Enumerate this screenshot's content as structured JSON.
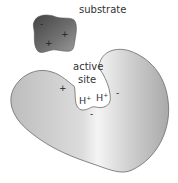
{
  "diagram": {
    "substrate": {
      "label": "substrate",
      "charges": [
        "-",
        "+",
        "+"
      ],
      "color_dark": "#3a3a3a",
      "color_light": "#a0a0a0"
    },
    "enzyme": {
      "active_site_label_line1": "active",
      "active_site_label_line2": "site",
      "site_charges": {
        "left": "+",
        "bottom": "-",
        "right": "-"
      },
      "ions": [
        "H+",
        "H+"
      ],
      "ion_text": "H",
      "ion_superscript": "+",
      "color_mid": "#c8c8c8",
      "color_light": "#f2f2f2",
      "outline": "#6a6a6a"
    }
  }
}
